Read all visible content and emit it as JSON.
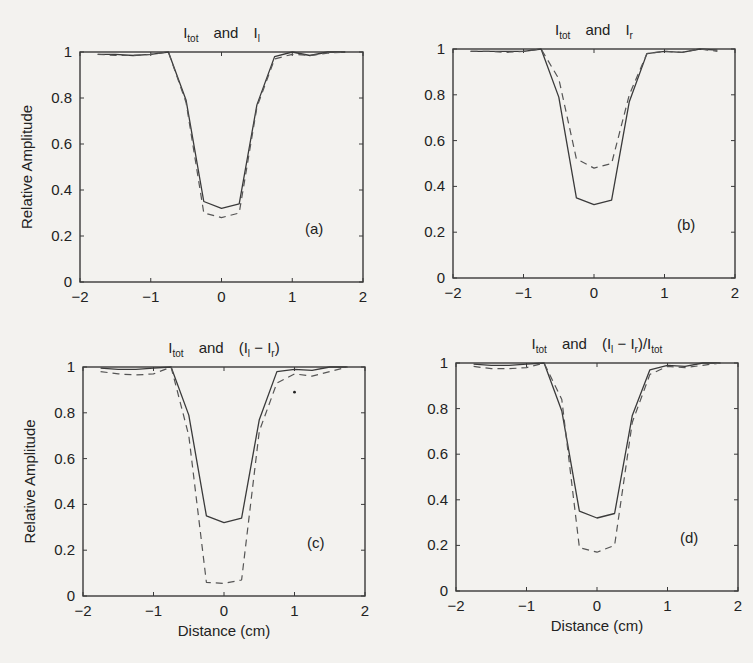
{
  "figure": {
    "background": "#f3f2ef",
    "line_color": "#3a3a3a"
  },
  "chart_data": [
    {
      "type": "line",
      "panel": "(a)",
      "title": "I_tot and I_l",
      "title_parts": {
        "a": "I",
        "a_sub": "tot",
        "mid": "and",
        "b": "I",
        "b_sub": "l",
        "b_tail": ""
      },
      "xlabel": "",
      "ylabel": "Relative Amplitude",
      "xlim": [
        -2,
        2
      ],
      "ylim": [
        0,
        1
      ],
      "xticks": [
        -2,
        -1,
        0,
        1,
        2
      ],
      "yticks": [
        0,
        0.2,
        0.4,
        0.6,
        0.8,
        1
      ],
      "grid": false,
      "frame_px": {
        "x": 80,
        "y": 52,
        "w": 283,
        "h": 230
      },
      "x": [
        -1.75,
        -1.5,
        -1.25,
        -1.0,
        -0.75,
        -0.5,
        -0.25,
        0.0,
        0.25,
        0.5,
        0.75,
        1.0,
        1.25,
        1.5,
        1.75
      ],
      "series": [
        {
          "name": "I_tot",
          "style": "solid",
          "values": [
            0.99,
            0.99,
            0.985,
            0.99,
            1.0,
            0.79,
            0.35,
            0.32,
            0.34,
            0.77,
            0.98,
            1.0,
            0.985,
            1.0,
            1.0
          ]
        },
        {
          "name": "I_l",
          "style": "dashed",
          "values": [
            0.99,
            0.985,
            0.985,
            0.99,
            1.0,
            0.78,
            0.3,
            0.28,
            0.3,
            0.76,
            0.97,
            0.99,
            0.985,
            0.995,
            1.0
          ]
        }
      ]
    },
    {
      "type": "line",
      "panel": "(b)",
      "title": "I_tot and I_r",
      "title_parts": {
        "a": "I",
        "a_sub": "tot",
        "mid": "and",
        "b": "I",
        "b_sub": "r",
        "b_tail": ""
      },
      "xlabel": "",
      "ylabel": "",
      "xlim": [
        -2,
        2
      ],
      "ylim": [
        0,
        1
      ],
      "xticks": [
        -2,
        -1,
        0,
        1,
        2
      ],
      "yticks": [
        0,
        0.2,
        0.4,
        0.6,
        0.8,
        1
      ],
      "grid": false,
      "frame_px": {
        "x": 453,
        "y": 49,
        "w": 282,
        "h": 229
      },
      "x": [
        -1.75,
        -1.5,
        -1.25,
        -1.0,
        -0.75,
        -0.5,
        -0.25,
        0.0,
        0.25,
        0.5,
        0.75,
        1.0,
        1.25,
        1.5,
        1.75
      ],
      "series": [
        {
          "name": "I_tot",
          "style": "solid",
          "values": [
            0.99,
            0.99,
            0.99,
            0.99,
            1.0,
            0.79,
            0.35,
            0.32,
            0.34,
            0.77,
            0.98,
            0.99,
            0.985,
            1.0,
            0.995
          ]
        },
        {
          "name": "I_r",
          "style": "dashed",
          "values": [
            0.99,
            0.99,
            0.985,
            0.99,
            1.0,
            0.87,
            0.52,
            0.48,
            0.5,
            0.8,
            0.98,
            0.99,
            0.985,
            1.0,
            0.99
          ]
        }
      ]
    },
    {
      "type": "line",
      "panel": "(c)",
      "title": "I_tot and (I_l − I_r)",
      "title_parts": {
        "a": "I",
        "a_sub": "tot",
        "mid": "and",
        "b": "(I",
        "b_sub": "l",
        "b_tail": "− I",
        "b_tail_sub": "r",
        "b_end": ")"
      },
      "xlabel": "Distance (cm)",
      "ylabel": "Relative Amplitude",
      "xlim": [
        -2,
        2
      ],
      "ylim": [
        0,
        1
      ],
      "xticks": [
        -2,
        -1,
        0,
        1,
        2
      ],
      "yticks": [
        0,
        0.2,
        0.4,
        0.6,
        0.8,
        1
      ],
      "grid": false,
      "frame_px": {
        "x": 83,
        "y": 367,
        "w": 282,
        "h": 229
      },
      "x": [
        -1.75,
        -1.5,
        -1.25,
        -1.0,
        -0.75,
        -0.5,
        -0.25,
        0.0,
        0.25,
        0.5,
        0.75,
        1.0,
        1.25,
        1.5,
        1.75
      ],
      "series": [
        {
          "name": "I_tot",
          "style": "solid",
          "values": [
            0.995,
            0.99,
            0.99,
            0.995,
            1.0,
            0.79,
            0.35,
            0.32,
            0.34,
            0.77,
            0.98,
            0.99,
            0.985,
            1.0,
            1.0
          ]
        },
        {
          "name": "I_l - I_r",
          "style": "dashed",
          "values": [
            0.98,
            0.97,
            0.965,
            0.97,
            1.0,
            0.7,
            0.06,
            0.055,
            0.07,
            0.72,
            0.93,
            0.97,
            0.96,
            0.98,
            1.0
          ]
        }
      ],
      "annotations": [
        {
          "type": "dot",
          "x": 1.0,
          "y": 0.89
        }
      ]
    },
    {
      "type": "line",
      "panel": "(d)",
      "title": "I_tot and (I_l − I_r)/I_tot",
      "title_parts": {
        "a": "I",
        "a_sub": "tot",
        "mid": "and",
        "b": "(I",
        "b_sub": "l",
        "b_tail": "− I",
        "b_tail_sub": "r",
        "b_end": ")/I",
        "b_end_sub": "tot"
      },
      "xlabel": "Distance (cm)",
      "ylabel": "",
      "xlim": [
        -2,
        2
      ],
      "ylim": [
        0,
        1
      ],
      "xticks": [
        -2,
        -1,
        0,
        1,
        2
      ],
      "yticks": [
        0,
        0.2,
        0.4,
        0.6,
        0.8,
        1
      ],
      "grid": false,
      "frame_px": {
        "x": 456,
        "y": 363,
        "w": 282,
        "h": 228
      },
      "x": [
        -1.75,
        -1.5,
        -1.25,
        -1.0,
        -0.75,
        -0.5,
        -0.25,
        0.0,
        0.25,
        0.5,
        0.75,
        1.0,
        1.25,
        1.5,
        1.75
      ],
      "series": [
        {
          "name": "I_tot",
          "style": "solid",
          "values": [
            0.995,
            0.99,
            0.99,
            0.995,
            1.0,
            0.79,
            0.35,
            0.32,
            0.34,
            0.77,
            0.97,
            0.99,
            0.985,
            1.0,
            1.0
          ]
        },
        {
          "name": "(I_l - I_r)/I_tot",
          "style": "dashed",
          "values": [
            0.985,
            0.975,
            0.975,
            0.98,
            1.0,
            0.84,
            0.19,
            0.17,
            0.2,
            0.74,
            0.95,
            0.985,
            0.98,
            0.99,
            1.0
          ]
        }
      ]
    }
  ]
}
